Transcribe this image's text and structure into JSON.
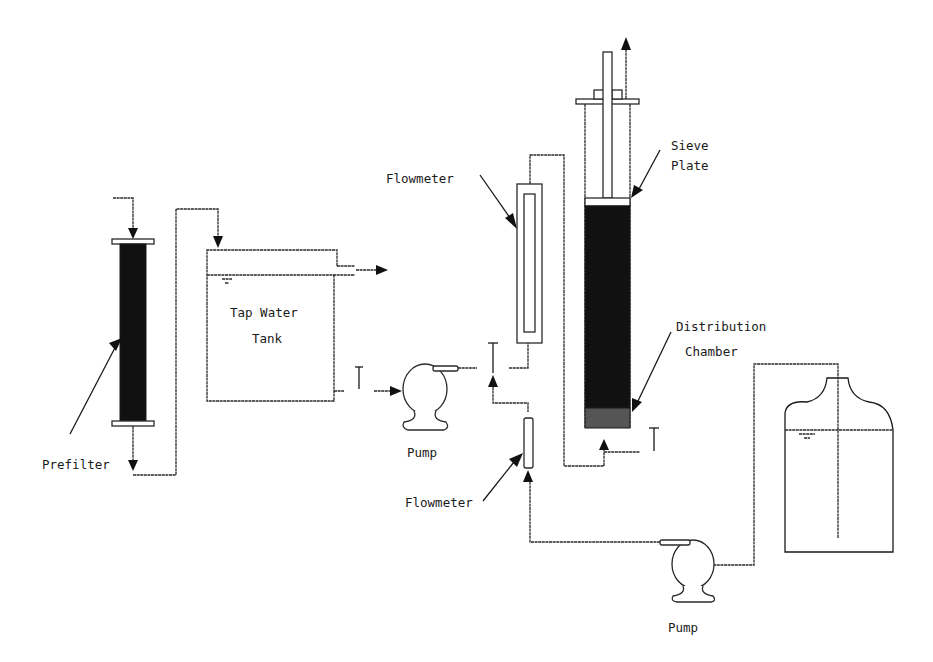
{
  "diagram": {
    "labels": {
      "prefilter": "Prefilter",
      "tank_line1": "Tap Water",
      "tank_line2": "Tank",
      "pump_top": "Pump",
      "pump_bottom": "Pump",
      "flowmeter_top": "Flowmeter",
      "flowmeter_bottom": "Flowmeter",
      "sieve_line1": "Sieve",
      "sieve_line2": "Plate",
      "distribution_line1": "Distribution",
      "distribution_line2": "Chamber"
    },
    "components": [
      {
        "id": "prefilter",
        "type": "filter-column",
        "label": "Prefilter"
      },
      {
        "id": "tap-water-tank",
        "type": "tank",
        "label": "Tap Water Tank"
      },
      {
        "id": "pump-1",
        "type": "pump",
        "label": "Pump"
      },
      {
        "id": "flowmeter-1",
        "type": "rotameter",
        "label": "Flowmeter"
      },
      {
        "id": "flowmeter-2",
        "type": "rotameter",
        "label": "Flowmeter"
      },
      {
        "id": "column",
        "type": "packed-column",
        "parts": [
          "Sieve Plate",
          "Distribution Chamber"
        ]
      },
      {
        "id": "pump-2",
        "type": "pump",
        "label": "Pump"
      },
      {
        "id": "reservoir",
        "type": "bottle"
      }
    ],
    "colors": {
      "line": "#2a2a2a",
      "fill_dark": "#111111",
      "background": "#ffffff"
    }
  }
}
